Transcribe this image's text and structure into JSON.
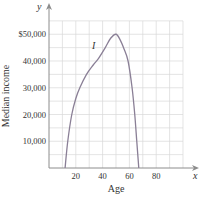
{
  "chart_data": {
    "type": "line",
    "title": "",
    "xlabel": "Age",
    "ylabel": "Median income",
    "x_axis_var": "x",
    "y_axis_var": "y",
    "xlim": [
      0,
      100
    ],
    "ylim": [
      0,
      55000
    ],
    "x_ticks": [
      20,
      40,
      60,
      80
    ],
    "x_tick_labels": [
      "20",
      "40",
      "60",
      "80"
    ],
    "y_ticks": [
      10000,
      20000,
      30000,
      40000,
      50000
    ],
    "y_tick_labels": [
      "10,000",
      "20,000",
      "30,000",
      "40,000",
      "$50,000"
    ],
    "grid": true,
    "grid_x_step": 10,
    "grid_y_step": 5000,
    "legend": null,
    "annotations": [
      {
        "text": "I",
        "x": 42,
        "y": 46000,
        "style": "italic"
      }
    ],
    "series": [
      {
        "name": "I",
        "color": "#8a7f96",
        "x": [
          12,
          14,
          17,
          20,
          23,
          28,
          33,
          37,
          42,
          46,
          50,
          53,
          56,
          59,
          62,
          64,
          65.5,
          67
        ],
        "values": [
          0,
          10000,
          20000,
          26000,
          30000,
          35000,
          38500,
          41000,
          45000,
          48500,
          50000,
          48000,
          44500,
          40000,
          30000,
          20000,
          10000,
          0
        ]
      }
    ]
  },
  "labels": {
    "x_var": "x",
    "y_var": "y",
    "xlabel": "Age",
    "ylabel": "Median income",
    "curve_label": "I"
  },
  "colors": {
    "grid": "#d9d9d9",
    "axis": "#8c8c8c",
    "curve": "#8a7f96",
    "text": "#333333"
  }
}
